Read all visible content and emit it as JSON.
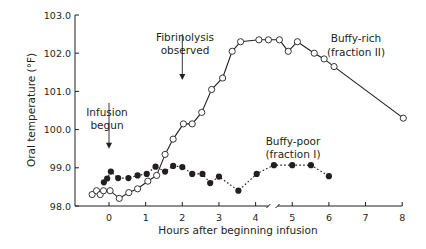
{
  "chart_data": {
    "type": "line",
    "title": "",
    "xlabel": "Hours after beginning infusion",
    "ylabel": "Oral temperature (°F)",
    "xlim": [
      -0.6,
      8
    ],
    "ylim": [
      98.0,
      103.0
    ],
    "x_ticks": [
      0,
      1,
      2,
      3,
      4,
      5,
      6,
      7,
      8
    ],
    "y_ticks": [
      "98.0",
      "99.0",
      "100.0",
      "101.0",
      "102.0",
      "103.0"
    ],
    "x_axis_break_between": [
      4,
      5
    ],
    "grid": false,
    "legend": "none (series labeled inline)",
    "series": [
      {
        "name": "Buffy-rich (fraction II)",
        "marker": "open-circle",
        "line": "solid",
        "x": [
          -0.46,
          -0.34,
          -0.24,
          -0.15,
          0.03,
          0.28,
          0.54,
          0.78,
          1.06,
          1.3,
          1.53,
          1.75,
          2.03,
          2.27,
          2.53,
          2.8,
          3.1,
          3.36,
          3.59,
          4.09,
          4.35,
          4.65,
          4.89,
          5.14,
          5.6,
          5.87,
          6.14,
          8.03
        ],
        "values": [
          98.3,
          98.4,
          98.3,
          98.4,
          98.4,
          98.2,
          98.35,
          98.45,
          98.65,
          98.8,
          99.35,
          99.75,
          100.15,
          100.15,
          100.45,
          101.05,
          101.35,
          102.05,
          102.3,
          102.35,
          102.35,
          102.35,
          102.05,
          102.3,
          102.0,
          101.85,
          101.65,
          100.3
        ]
      },
      {
        "name": "Buffy-poor (fraction I)",
        "marker": "filled-circle",
        "line": "dotted",
        "x": [
          -0.14,
          -0.05,
          0.05,
          0.25,
          0.53,
          0.78,
          1.03,
          1.27,
          1.53,
          1.75,
          2.0,
          2.27,
          2.55,
          2.76,
          3.0,
          3.53,
          4.03,
          4.5,
          5.0,
          5.51,
          6.0
        ],
        "values": [
          98.62,
          98.72,
          98.9,
          98.73,
          98.73,
          98.8,
          98.84,
          99.03,
          98.9,
          99.05,
          99.02,
          98.84,
          98.84,
          98.6,
          98.77,
          98.4,
          98.84,
          99.07,
          99.07,
          99.07,
          98.78
        ]
      }
    ],
    "annotations": [
      {
        "text": [
          "Infusion",
          "begun"
        ],
        "arrow_at_x": 0,
        "arrow_from_y": 100.7,
        "arrow_to_y": 99.5
      },
      {
        "text": [
          "Fibrinolysis",
          "observed"
        ],
        "arrow_at_x": 2,
        "arrow_from_y": 102.5,
        "arrow_to_y": 101.3
      },
      {
        "text": [
          "Buffy-rich",
          "(fraction II)"
        ]
      },
      {
        "text": [
          "Buffy-poor",
          "(fraction I)"
        ]
      }
    ]
  }
}
